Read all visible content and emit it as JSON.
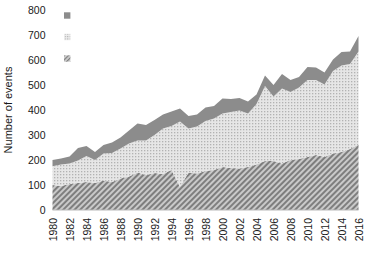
{
  "chart_data": {
    "type": "area",
    "stacked": true,
    "title": "",
    "xlabel": "",
    "ylabel": "Number of events",
    "ylim": [
      0,
      800
    ],
    "ytick_step": 100,
    "yticks": [
      "0",
      "100",
      "200",
      "300",
      "400",
      "500",
      "600",
      "700",
      "800"
    ],
    "grid": false,
    "legend_position": "top-left-inside",
    "x": [
      1980,
      1981,
      1982,
      1983,
      1984,
      1985,
      1986,
      1987,
      1988,
      1989,
      1990,
      1991,
      1992,
      1993,
      1994,
      1995,
      1996,
      1997,
      1998,
      1999,
      2000,
      2001,
      2002,
      2003,
      2004,
      2005,
      2006,
      2007,
      2008,
      2009,
      2010,
      2011,
      2012,
      2013,
      2014,
      2015,
      2016
    ],
    "xtick_labels": [
      "1980",
      "1982",
      "1984",
      "1986",
      "1988",
      "1990",
      "1992",
      "1994",
      "1996",
      "1998",
      "2000",
      "2002",
      "2004",
      "2006",
      "2008",
      "2010",
      "2012",
      "2014",
      "2016"
    ],
    "series": [
      {
        "name": "Meteorological: Storms",
        "legend_label": "Meteorological: Storms",
        "pattern": "diagonal-hatch",
        "color": "#8f8f8f",
        "values": [
          100,
          96,
          104,
          108,
          112,
          108,
          118,
          112,
          126,
          134,
          150,
          140,
          148,
          144,
          160,
          92,
          150,
          146,
          156,
          160,
          172,
          168,
          166,
          172,
          182,
          196,
          196,
          186,
          200,
          204,
          212,
          220,
          212,
          226,
          232,
          244,
          262
        ]
      },
      {
        "name": "Hydrological: Floods, landslides, avalanches",
        "legend_label": "Hydrological: Floods, landslides, avalanches",
        "pattern": "fine-dots",
        "color": "#d2d2d2",
        "values": [
          75,
          86,
          82,
          90,
          104,
          92,
          108,
          116,
          120,
          132,
          128,
          138,
          152,
          182,
          176,
          262,
          176,
          188,
          200,
          206,
          214,
          224,
          232,
          214,
          242,
          300,
          258,
          300,
          272,
          286,
          308,
          300,
          290,
          330,
          346,
          340,
          372
        ]
      },
      {
        "name": "Climatological: Heatwaves, drought, wildfires",
        "legend_label": "Climatological: Heatwaves, drought, wildfires",
        "pattern": "solid",
        "color": "#8c8c8c",
        "values": [
          25,
          24,
          28,
          50,
          40,
          32,
          34,
          42,
          44,
          52,
          68,
          62,
          60,
          56,
          58,
          52,
          50,
          48,
          54,
          50,
          60,
          52,
          50,
          48,
          38,
          42,
          46,
          58,
          48,
          42,
          52,
          50,
          48,
          46,
          54,
          50,
          62
        ]
      }
    ],
    "totals": [
      200,
      206,
      214,
      248,
      256,
      232,
      260,
      270,
      290,
      318,
      346,
      340,
      360,
      382,
      394,
      406,
      376,
      382,
      410,
      416,
      446,
      444,
      448,
      434,
      462,
      538,
      500,
      544,
      520,
      532,
      572,
      570,
      550,
      602,
      632,
      634,
      696
    ]
  },
  "legend": {
    "items": [
      {
        "label": "Climatological: Heatwaves, drought, wildfires",
        "swatch": "solid-gray-square"
      },
      {
        "label": "Hydrological: Floods, landslides, avalanches",
        "swatch": "dotted-square"
      },
      {
        "label": "Meteorological: Storms",
        "swatch": "hatched-square"
      }
    ]
  }
}
